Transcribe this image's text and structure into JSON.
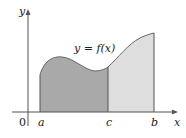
{
  "figure": {
    "curve_label": "y = f(x)",
    "y_axis_label": "y",
    "x_axis_label": "x",
    "origin_label": "0",
    "tick_labels": {
      "a": "a",
      "c": "c",
      "b": "b"
    },
    "colors": {
      "region_a_to_c": "#a9a9a9",
      "region_c_to_b": "#dedede",
      "axes": "#555555",
      "curve": "#666666"
    }
  }
}
